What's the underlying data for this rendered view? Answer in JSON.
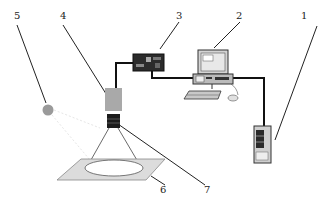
{
  "diagram": {
    "type": "system schematic",
    "labels": [
      {
        "id": "1",
        "target": "power-supply-tower",
        "x": 301,
        "y": 11
      },
      {
        "id": "2",
        "target": "computer-workstation",
        "x": 236,
        "y": 11
      },
      {
        "id": "3",
        "target": "controller-box",
        "x": 176,
        "y": 11
      },
      {
        "id": "4",
        "target": "camera-body",
        "x": 60,
        "y": 11
      },
      {
        "id": "5",
        "target": "light-source",
        "x": 14,
        "y": 11
      },
      {
        "id": "6",
        "target": "sample-platform",
        "x": 160,
        "y": 185
      },
      {
        "id": "7",
        "target": "lens",
        "x": 204,
        "y": 185
      }
    ],
    "colors": {
      "line": "#1a1a1a",
      "camera": "#a9a9a9",
      "lens": "#1c1c1c",
      "light": "#9a9a9a",
      "platform": "#dcdcdc",
      "cable": "#111111"
    }
  }
}
